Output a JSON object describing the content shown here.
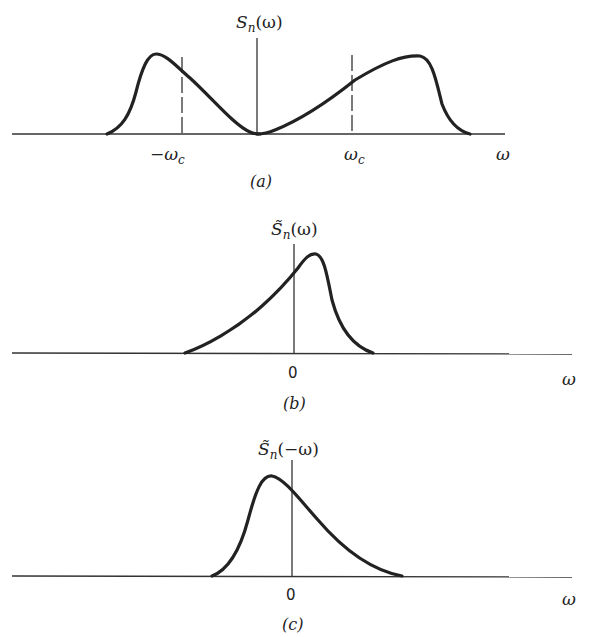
{
  "panels": [
    {
      "id": "a",
      "caption": "(a)",
      "ylabel_main": "S",
      "ylabel_sub": "n",
      "ylabel_arg": "(ω)",
      "xlabel": "ω",
      "ticks": [
        "−ω",
        "ω"
      ],
      "tick_sub": "c"
    },
    {
      "id": "b",
      "caption": "(b)",
      "ylabel_main": "S̃",
      "ylabel_sub": "n",
      "ylabel_arg": "(ω)",
      "xlabel": "ω",
      "ticks": [
        "0"
      ]
    },
    {
      "id": "c",
      "caption": "(c)",
      "ylabel_main": "S̃",
      "ylabel_sub": "n",
      "ylabel_arg": "(−ω)",
      "xlabel": "ω",
      "ticks": [
        "0"
      ]
    }
  ],
  "colors": {
    "ink": "#222222",
    "background": "#ffffff"
  }
}
